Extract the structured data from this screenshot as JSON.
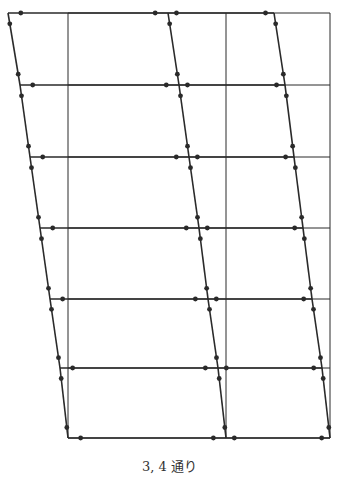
{
  "caption": "3, 4 通り",
  "diagram": {
    "type": "frame-deformation",
    "bays": 2,
    "stories": 6,
    "grid_x": [
      68,
      226,
      330
    ],
    "grid_y": [
      13,
      85,
      157,
      228,
      299,
      368,
      438
    ],
    "deformed_x_offsets": [
      [
        -60,
        -58,
        -56
      ],
      [
        -48,
        -47,
        -45
      ],
      [
        -38,
        -37,
        -36
      ],
      [
        -28,
        -27,
        -27
      ],
      [
        -18,
        -18,
        -18
      ],
      [
        -8,
        -8,
        -8
      ],
      [
        0,
        0,
        0
      ]
    ],
    "line_color": "#2a2a2a"
  }
}
